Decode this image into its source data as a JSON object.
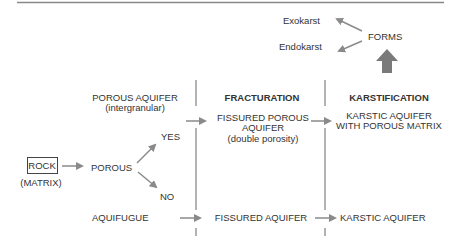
{
  "top": {
    "exokarst": "Exokarst",
    "endokarst": "Endokarst",
    "forms": "FORMS"
  },
  "headers": {
    "porous_aquifer": "POROUS AQUIFER",
    "porous_aquifer_sub": "(intergranular)",
    "fracturation": "FRACTURATION",
    "karstification": "KARSTIFICATION"
  },
  "left": {
    "rock": "ROCK",
    "matrix": "(MATRIX)",
    "porous": "POROUS",
    "yes": "YES",
    "no": "NO",
    "aquifugue": "AQUIFUGUE"
  },
  "middle": {
    "fissured_porous_line1": "FISSURED POROUS",
    "fissured_porous_line2": "AQUIFER",
    "double_porosity": "(double porosity)",
    "fissured_aquifer": "FISSURED AQUIFER"
  },
  "right": {
    "karstic_matrix_line1": "KARSTIC AQUIFER",
    "karstic_matrix_line2": "WITH POROUS MATRIX",
    "karstic_aquifer": "KARSTIC AQUIFER"
  },
  "colors": {
    "line": "#888888",
    "arrow": "#8a8a8a",
    "text": "#333333"
  }
}
